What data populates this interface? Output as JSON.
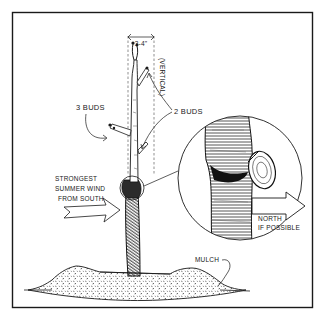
{
  "illustration": {
    "subject": "young tree planting with graft union detail",
    "colors": {
      "ink": "#1a1a1a",
      "paper": "#ffffff",
      "hatch": "#3a3a3a"
    },
    "labels": {
      "height_dim": "3-4\"",
      "vertical": "(VERTICAL)",
      "three_buds": "3 BUDS",
      "two_buds": "2 BUDS",
      "wind_line1": "STRONGEST",
      "wind_line2": "SUMMER WIND",
      "wind_line3": "FROM SOUTH",
      "north_line1": "NORTH",
      "north_line2": "IF POSSIBLE",
      "mulch": "MULCH"
    }
  }
}
